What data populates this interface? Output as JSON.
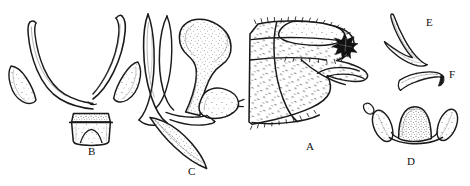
{
  "plate": {
    "width": 470,
    "height": 186,
    "background_color": "#ffffff",
    "ink_color": "#1a1a1a",
    "stipple_color": "#555555",
    "top_caption_partial": "▪ ▪▪ ▪▪▪ ▪▪▪▪ (▪▪▪▪▪▪)▪",
    "figure_labels": [
      {
        "id": "B",
        "text": "B",
        "x": 88,
        "y": 146
      },
      {
        "id": "C",
        "text": "C",
        "x": 188,
        "y": 166
      },
      {
        "id": "A",
        "text": "A",
        "x": 306,
        "y": 141
      },
      {
        "id": "D",
        "text": "D",
        "x": 407,
        "y": 156
      },
      {
        "id": "E",
        "text": "E",
        "x": 426,
        "y": 17
      },
      {
        "id": "F",
        "text": "F",
        "x": 449,
        "y": 69
      }
    ],
    "figures": [
      {
        "id": "B",
        "label": "B",
        "description": "Ventral view of forked U-shaped sclerite with paired lateral crescents and central notched trapezoidal plate"
      },
      {
        "id": "C",
        "label": "C",
        "description": "Lateral view with bulbous funnel-shaped dorsal lobe, slender curved arm and pointed stippled ventral blade"
      },
      {
        "id": "A",
        "label": "A",
        "description": "Lateral view of segmented stippled abdominal apex bearing setae and a dark blot marking"
      },
      {
        "id": "D",
        "label": "D",
        "description": "Stippled central dome flanked by two pointed lateral lobes"
      },
      {
        "id": "E",
        "label": "E",
        "description": "Slender elongate S-curved hook-shaped sclerite"
      },
      {
        "id": "F",
        "label": "F",
        "description": "Small narrow curved crescent-shaped sclerite"
      }
    ]
  }
}
